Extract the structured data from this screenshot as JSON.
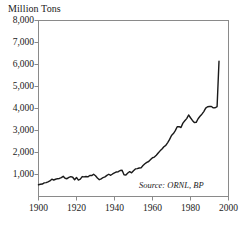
{
  "chart_data": {
    "type": "line",
    "title": "Million Tons",
    "xlabel": "",
    "ylabel": "Million Tons",
    "xlim": [
      1900,
      2000
    ],
    "ylim": [
      0,
      8000
    ],
    "grid": false,
    "legend": null,
    "annotations": [
      {
        "name": "source",
        "text": "Source: ORNL, BP"
      }
    ],
    "ytick_labels": [
      "8,000",
      "7,000",
      "6,000",
      "5,000",
      "4,000",
      "3,000",
      "2,000",
      "1,000"
    ],
    "ytick_values": [
      8000,
      7000,
      6000,
      5000,
      4000,
      3000,
      2000,
      1000
    ],
    "xtick_labels": [
      "1900",
      "1920",
      "1940",
      "1960",
      "1980",
      "2000"
    ],
    "xtick_values": [
      1900,
      1920,
      1940,
      1960,
      1980,
      2000
    ],
    "series": [
      {
        "name": "Carbon emissions",
        "color": "#1a1a1a",
        "x": [
          1900,
          1901,
          1902,
          1903,
          1904,
          1905,
          1906,
          1907,
          1908,
          1909,
          1910,
          1911,
          1912,
          1913,
          1914,
          1915,
          1916,
          1917,
          1918,
          1919,
          1920,
          1921,
          1922,
          1923,
          1924,
          1925,
          1926,
          1927,
          1928,
          1929,
          1930,
          1931,
          1932,
          1933,
          1934,
          1935,
          1936,
          1937,
          1938,
          1939,
          1940,
          1941,
          1942,
          1943,
          1944,
          1945,
          1946,
          1947,
          1948,
          1949,
          1950,
          1951,
          1952,
          1953,
          1954,
          1955,
          1956,
          1957,
          1958,
          1959,
          1960,
          1961,
          1962,
          1963,
          1964,
          1965,
          1966,
          1967,
          1968,
          1969,
          1970,
          1971,
          1972,
          1973,
          1974,
          1975,
          1976,
          1977,
          1978,
          1979,
          1980,
          1981,
          1982,
          1983,
          1984,
          1985,
          1986,
          1987,
          1988,
          1989,
          1990,
          1991,
          1992,
          1993,
          1994,
          1995
        ],
        "values": [
          534,
          556,
          566,
          617,
          629,
          666,
          708,
          786,
          751,
          783,
          810,
          819,
          861,
          918,
          829,
          809,
          866,
          902,
          877,
          761,
          866,
          748,
          786,
          906,
          891,
          909,
          891,
          955,
          952,
          1012,
          940,
          841,
          765,
          801,
          862,
          892,
          961,
          1012,
          964,
          1024,
          1072,
          1115,
          1127,
          1183,
          1194,
          984,
          977,
          1068,
          1128,
          1077,
          1170,
          1254,
          1265,
          1297,
          1301,
          1407,
          1489,
          1553,
          1591,
          1677,
          1763,
          1791,
          1875,
          1977,
          2075,
          2158,
          2261,
          2324,
          2449,
          2596,
          2774,
          2861,
          2993,
          3169,
          3174,
          3136,
          3336,
          3441,
          3540,
          3705,
          3579,
          3459,
          3366,
          3368,
          3534,
          3646,
          3741,
          3859,
          4017,
          4081,
          4092,
          4090,
          4030,
          4033,
          4087,
          6150
        ]
      }
    ],
    "display_values": [
      534,
      556,
      566,
      617,
      629,
      666,
      708,
      786,
      751,
      783,
      810,
      819,
      861,
      918,
      829,
      809,
      866,
      902,
      877,
      761,
      866,
      748,
      786,
      906,
      891,
      909,
      891,
      955,
      952,
      1012,
      940,
      841,
      765,
      801,
      862,
      892,
      961,
      1012,
      964,
      1024,
      1072,
      1115,
      1127,
      1183,
      1194,
      984,
      977,
      1068,
      1128,
      1077,
      1170,
      1254,
      1265,
      1297,
      1301,
      1407,
      1489,
      1553,
      1591,
      1677,
      1763,
      1791,
      1875,
      1977,
      2075,
      2158,
      2261,
      2324,
      2449,
      2596,
      2774,
      2861,
      2993,
      3169,
      3174,
      3136,
      3336,
      3441,
      3540,
      3705,
      3579,
      3459,
      3366,
      3368,
      3534,
      3646,
      3741,
      3859,
      4017,
      4081,
      4092,
      4090,
      4030,
      4033,
      4087,
      6150
    ]
  },
  "figure": {
    "title": "Million Tons",
    "source_note": "Source: ORNL, BP",
    "line_color": "#1a1a1a",
    "frame_color": "#8a8a8a",
    "background": "#ffffff"
  }
}
